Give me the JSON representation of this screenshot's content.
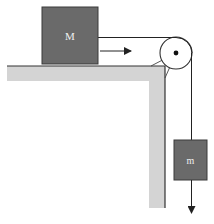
{
  "diagram": {
    "type": "physics-pulley-system",
    "blocks": {
      "table_block": {
        "label": "M"
      },
      "hanging_block": {
        "label": "m"
      }
    },
    "colors": {
      "block_fill": "#6a6a6a",
      "block_stroke": "#3a3a3a",
      "table_fill": "#d4d4d4",
      "table_edge": "#333333",
      "rope": "#222222",
      "pulley_fill": "#ffffff"
    }
  }
}
